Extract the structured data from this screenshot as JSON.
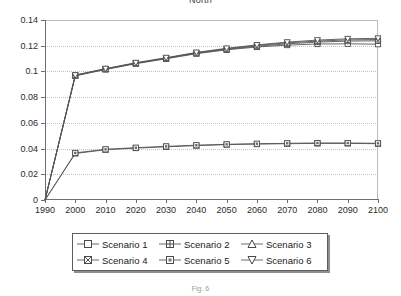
{
  "chart_data": {
    "type": "line",
    "title": "North",
    "caption": "Fig. 6",
    "xlabel": "",
    "ylabel": "",
    "x": [
      1990,
      2000,
      2010,
      2020,
      2030,
      2040,
      2050,
      2060,
      2070,
      2080,
      2090,
      2100
    ],
    "xlim": [
      1990,
      2100
    ],
    "ylim": [
      0,
      0.14
    ],
    "yticks": [
      0,
      0.02,
      0.04,
      0.06,
      0.08,
      0.1,
      0.12,
      0.14
    ],
    "ytick_labels": [
      "0",
      "0.02",
      "0.04",
      "0.06",
      "0.08",
      "0.1",
      "0.12",
      "0.14"
    ],
    "xtick_labels": [
      "1990",
      "2000",
      "2010",
      "2020",
      "2030",
      "2040",
      "2050",
      "2060",
      "2070",
      "2080",
      "2090",
      "2100"
    ],
    "grid": "horizontal-dotted",
    "legend_position": "below-center",
    "series": [
      {
        "name": "Scenario 1",
        "marker": "square-open",
        "values": [
          0,
          0.0965,
          0.1015,
          0.106,
          0.1098,
          0.1138,
          0.1168,
          0.119,
          0.1205,
          0.1213,
          0.1215,
          0.1212
        ]
      },
      {
        "name": "Scenario 2",
        "marker": "square-hbar",
        "values": [
          0,
          0.0968,
          0.1018,
          0.1063,
          0.1102,
          0.1142,
          0.1172,
          0.1196,
          0.1215,
          0.1228,
          0.1236,
          0.1238
        ]
      },
      {
        "name": "Scenario 3",
        "marker": "triangle-up",
        "values": [
          0,
          0.097,
          0.102,
          0.1065,
          0.1104,
          0.1145,
          0.1176,
          0.1202,
          0.1222,
          0.1236,
          0.1245,
          0.1248
        ]
      },
      {
        "name": "Scenario 4",
        "marker": "square-cross",
        "values": [
          0,
          0.0362,
          0.0391,
          0.0404,
          0.0414,
          0.0423,
          0.0431,
          0.0435,
          0.0438,
          0.044,
          0.044,
          0.0438
        ]
      },
      {
        "name": "Scenario 5",
        "marker": "square-dotted",
        "values": [
          0,
          0.0366,
          0.0394,
          0.0407,
          0.0417,
          0.0426,
          0.0433,
          0.0438,
          0.0441,
          0.0443,
          0.0443,
          0.0441
        ]
      },
      {
        "name": "Scenario 6",
        "marker": "triangle-down",
        "values": [
          0,
          0.0972,
          0.1022,
          0.1068,
          0.1107,
          0.1148,
          0.118,
          0.1206,
          0.1228,
          0.1244,
          0.1254,
          0.1258
        ]
      }
    ],
    "colors": {
      "line": "#555555",
      "grid": "#c2c2c2",
      "axis": "#6e6e6e",
      "text": "#1a1a1a"
    }
  },
  "legend": {
    "rows": [
      [
        "Scenario 1",
        "Scenario 2",
        "Scenario 3"
      ],
      [
        "Scenario 4",
        "Scenario 5",
        "Scenario 6"
      ]
    ]
  }
}
